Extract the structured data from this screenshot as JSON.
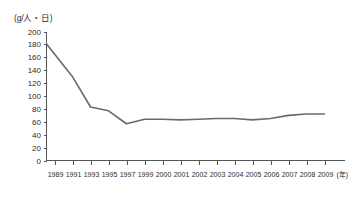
{
  "chart_data": {
    "type": "line",
    "title": "",
    "subtitle": "",
    "xlabel": "(年)",
    "ylabel": "(g/人・日)",
    "categories": [
      "1989",
      "1991",
      "1993",
      "1995",
      "1997",
      "1999",
      "2000",
      "2001",
      "2002",
      "2003",
      "2004",
      "2005",
      "2006",
      "2007",
      "2008",
      "2009"
    ],
    "values": [
      180,
      130,
      83,
      77,
      57,
      64,
      64,
      63,
      64,
      65,
      65,
      63,
      65,
      70,
      72,
      72
    ],
    "series": [
      {
        "name": "",
        "values": [
          180,
          130,
          83,
          77,
          57,
          64,
          64,
          63,
          64,
          65,
          65,
          63,
          65,
          70,
          72,
          72
        ]
      }
    ],
    "ylim": [
      0,
      200
    ],
    "yticks": [
      0,
      20,
      40,
      60,
      80,
      100,
      120,
      140,
      160,
      180,
      200
    ],
    "ytick_labels": [
      "0",
      "20",
      "40",
      "60",
      "80",
      "100",
      "120",
      "140",
      "160",
      "180",
      "200"
    ],
    "xtick_labels": [
      "1989",
      "1991",
      "1993",
      "1995",
      "1997",
      "1999",
      "2000",
      "2001",
      "2002",
      "2003",
      "2004",
      "2005",
      "2006",
      "2007",
      "2008",
      "2009"
    ],
    "grid": false,
    "legend": null,
    "legend_position": "none",
    "line_color": "#6a6a6a",
    "axis_color": "#555555",
    "background_color": "#ffffff",
    "annotations": []
  }
}
